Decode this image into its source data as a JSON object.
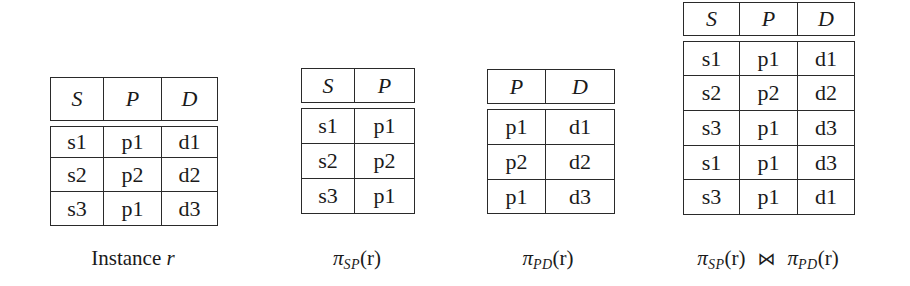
{
  "relations": [
    {
      "id": "instance-r",
      "columns": [
        "S",
        "P",
        "D"
      ],
      "rows": [
        [
          "s1",
          "p1",
          "d1"
        ],
        [
          "s2",
          "p2",
          "d2"
        ],
        [
          "s3",
          "p1",
          "d3"
        ]
      ],
      "caption": {
        "text": "Instance",
        "var": "r"
      }
    },
    {
      "id": "pi-sp",
      "columns": [
        "S",
        "P"
      ],
      "rows": [
        [
          "s1",
          "p1"
        ],
        [
          "s2",
          "p2"
        ],
        [
          "s3",
          "p1"
        ]
      ],
      "caption": {
        "pi": "π",
        "sub": "SP",
        "arg": "(r)"
      }
    },
    {
      "id": "pi-pd",
      "columns": [
        "P",
        "D"
      ],
      "rows": [
        [
          "p1",
          "d1"
        ],
        [
          "p2",
          "d2"
        ],
        [
          "p1",
          "d3"
        ]
      ],
      "caption": {
        "pi": "π",
        "sub": "PD",
        "arg": "(r)"
      }
    },
    {
      "id": "natural-join",
      "columns": [
        "S",
        "P",
        "D"
      ],
      "rows": [
        [
          "s1",
          "p1",
          "d1"
        ],
        [
          "s2",
          "p2",
          "d2"
        ],
        [
          "s3",
          "p1",
          "d3"
        ],
        [
          "s1",
          "p1",
          "d3"
        ],
        [
          "s3",
          "p1",
          "d1"
        ]
      ],
      "caption": {
        "left_pi": "π",
        "left_sub": "SP",
        "left_arg": "(r)",
        "join_symbol": "⋈",
        "right_pi": "π",
        "right_sub": "PD",
        "right_arg": "(r)"
      }
    }
  ]
}
